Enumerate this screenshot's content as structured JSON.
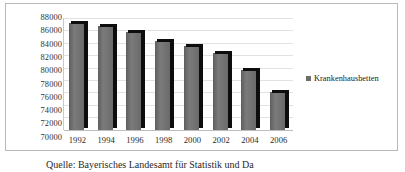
{
  "chart_data": {
    "type": "bar",
    "title": "",
    "xlabel": "",
    "ylabel": "",
    "categories": [
      "1992",
      "1994",
      "1996",
      "1998",
      "2000",
      "2002",
      "2004",
      "2006"
    ],
    "series": [
      {
        "name": "Krankenhausbetten",
        "values": [
          87200,
          86800,
          85800,
          84300,
          83500,
          82500,
          79700,
          76200
        ]
      }
    ],
    "ylim": [
      70000,
      88000
    ],
    "ytick_step": 2000,
    "yticks": [
      88000,
      86000,
      84000,
      82000,
      80000,
      78000,
      76000,
      74000,
      72000,
      70000
    ],
    "ytick_labels": [
      "88000",
      "86000",
      "84000",
      "82000",
      "80000",
      "78000",
      "76000",
      "74000",
      "72000",
      "70000"
    ],
    "grid": true,
    "legend_position": "right",
    "legend_entries": [
      "Krankenhausbetten"
    ],
    "bar_color": "#6e6e6e",
    "bar_edge_color": "#0d0d0d",
    "gridline_color": "#e2e2e2",
    "plot_background": "#ffffff",
    "frame_border_color": "#b9b9b9"
  },
  "caption": {
    "source_text": "Quelle: Bayerisches Landesamt für Statistik und Da"
  }
}
